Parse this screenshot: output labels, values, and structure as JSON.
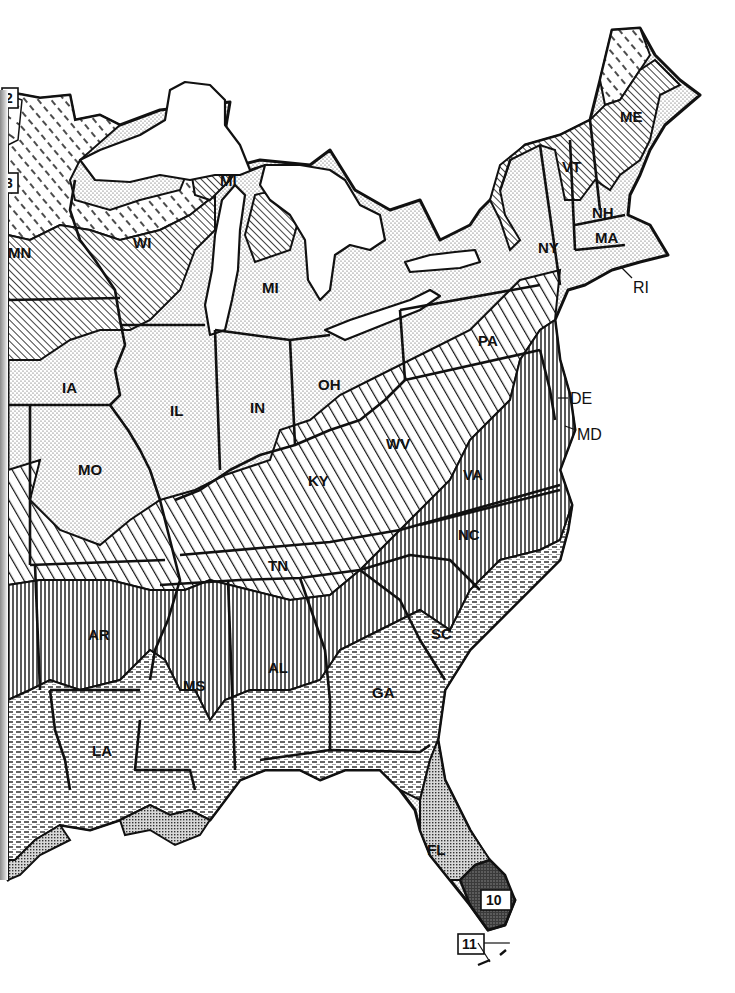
{
  "map": {
    "type": "plant hardiness zone map",
    "region": "Eastern United States",
    "zone_labels": [
      {
        "label": "2",
        "x": 10,
        "y": 103
      },
      {
        "label": "3",
        "x": 10,
        "y": 188
      },
      {
        "label": "10",
        "x": 497,
        "y": 904
      },
      {
        "label": "11",
        "x": 467,
        "y": 946
      }
    ],
    "states": [
      {
        "abbr": "ME",
        "x": 632,
        "y": 120
      },
      {
        "abbr": "VT",
        "x": 570,
        "y": 170
      },
      {
        "abbr": "NH",
        "x": 600,
        "y": 215
      },
      {
        "abbr": "MA",
        "x": 603,
        "y": 240
      },
      {
        "abbr": "NY",
        "x": 549,
        "y": 250
      },
      {
        "abbr": "MN",
        "x": 20,
        "y": 255
      },
      {
        "abbr": "WI",
        "x": 145,
        "y": 245
      },
      {
        "abbr": "MI",
        "x": 228,
        "y": 183
      },
      {
        "abbr": "MI",
        "x": 270,
        "y": 290
      },
      {
        "abbr": "PA",
        "x": 490,
        "y": 343
      },
      {
        "abbr": "IA",
        "x": 70,
        "y": 390
      },
      {
        "abbr": "IL",
        "x": 177,
        "y": 413
      },
      {
        "abbr": "IN",
        "x": 260,
        "y": 410
      },
      {
        "abbr": "OH",
        "x": 330,
        "y": 387
      },
      {
        "abbr": "WV",
        "x": 400,
        "y": 446
      },
      {
        "abbr": "MO",
        "x": 90,
        "y": 472
      },
      {
        "abbr": "KY",
        "x": 320,
        "y": 483
      },
      {
        "abbr": "VA",
        "x": 475,
        "y": 477
      },
      {
        "abbr": "NC",
        "x": 470,
        "y": 537
      },
      {
        "abbr": "TN",
        "x": 280,
        "y": 568
      },
      {
        "abbr": "AR",
        "x": 100,
        "y": 637
      },
      {
        "abbr": "SC",
        "x": 443,
        "y": 636
      },
      {
        "abbr": "MS",
        "x": 195,
        "y": 688
      },
      {
        "abbr": "AL",
        "x": 280,
        "y": 670
      },
      {
        "abbr": "GA",
        "x": 385,
        "y": 695
      },
      {
        "abbr": "LA",
        "x": 103,
        "y": 753
      },
      {
        "abbr": "FL",
        "x": 437,
        "y": 852
      }
    ],
    "outside_labels": [
      {
        "abbr": "RI",
        "x": 633,
        "y": 290
      },
      {
        "abbr": "DE",
        "x": 571,
        "y": 400
      },
      {
        "abbr": "MD",
        "x": 576,
        "y": 437
      }
    ],
    "zone_patterns": {
      "zone_2": "dashed-diagonal-sparse",
      "zone_3": "dashed-diagonal",
      "zone_4": "fine-diagonal",
      "zone_5": "stipple-dots",
      "zone_6": "wide-diagonal",
      "zone_7": "vertical-lines",
      "zone_8": "horizontal-dashes",
      "zone_9": "fine-crosshatch-dots",
      "zone_10": "dense-dark-dots",
      "zone_11": "blank"
    },
    "colors": {
      "ink": "#111111",
      "paper": "#ffffff"
    }
  }
}
